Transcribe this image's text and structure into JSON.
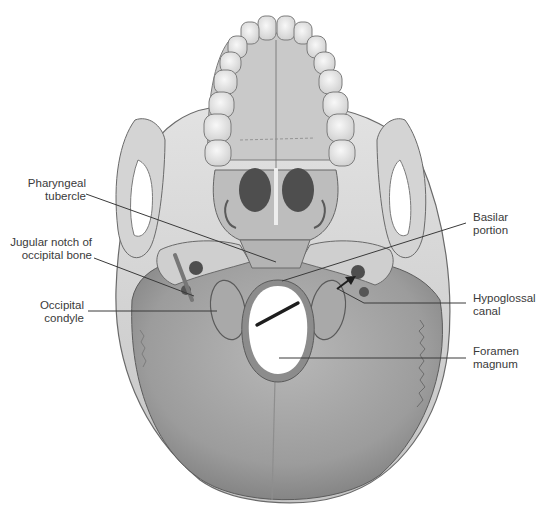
{
  "figure": {
    "colors": {
      "background": "#ffffff",
      "bone_light": "#d9d9d9",
      "bone_mid": "#b3b3b3",
      "bone_dark": "#8a8a8a",
      "occipital": "#a6a6a6",
      "teeth": "#eeeeee",
      "leader_line": "#3a3a3a",
      "text": "#3a3a3a"
    }
  },
  "labels_left": [
    {
      "id": "pharyngeal-tubercle",
      "lines": [
        "Pharyngeal",
        "tubercle"
      ],
      "x": 18,
      "y": 177,
      "line_from": [
        86,
        194
      ],
      "line_to": [
        276,
        262
      ]
    },
    {
      "id": "jugular-notch",
      "lines": [
        "Jugular notch of",
        "occipital bone"
      ],
      "x": 13,
      "y": 236,
      "line_from": [
        94,
        258
      ],
      "line_to": [
        194,
        296
      ]
    },
    {
      "id": "occipital-condyle",
      "lines": [
        "Occipital",
        "condyle"
      ],
      "x": 40,
      "y": 300,
      "line_from": [
        88,
        311
      ],
      "line_to": [
        217,
        311
      ]
    }
  ],
  "labels_right": [
    {
      "id": "basilar-portion",
      "lines": [
        "Basilar",
        "portion"
      ],
      "x": 473,
      "y": 211,
      "line_from": [
        466,
        223
      ],
      "line_to": [
        282,
        281
      ]
    },
    {
      "id": "hypoglossal-canal",
      "lines": [
        "Hypoglossal",
        "canal"
      ],
      "x": 473,
      "y": 292,
      "line_from": [
        466,
        303
      ],
      "line_to": [
        364,
        303
      ]
    },
    {
      "id": "foramen-magnum",
      "lines": [
        "Foramen",
        "magnum"
      ],
      "x": 473,
      "y": 345,
      "line_from": [
        466,
        358
      ],
      "line_to": [
        279,
        358
      ]
    }
  ],
  "arrows": [
    {
      "id": "hypoglossal-arrow",
      "from": [
        340,
        288
      ],
      "to": [
        355,
        276
      ]
    },
    {
      "id": "foramen-pointer",
      "from": [
        278,
        302
      ],
      "to": [
        256,
        324
      ]
    }
  ]
}
